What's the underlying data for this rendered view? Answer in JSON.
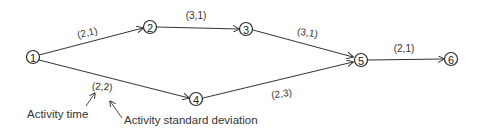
{
  "diagram": {
    "type": "activity network",
    "nodes": [
      {
        "id": "1",
        "label": "1",
        "x": 33,
        "y": 57
      },
      {
        "id": "2",
        "label": "2",
        "x": 150,
        "y": 27
      },
      {
        "id": "3",
        "label": "3",
        "x": 246,
        "y": 29
      },
      {
        "id": "4",
        "label": "4",
        "x": 196,
        "y": 99
      },
      {
        "id": "5",
        "label": "5",
        "x": 361,
        "y": 60
      },
      {
        "id": "6",
        "label": "6",
        "x": 451,
        "y": 59
      }
    ],
    "edges": [
      {
        "from": "1",
        "to": "2",
        "label": "(2,1)"
      },
      {
        "from": "2",
        "to": "3",
        "label": "(3,1)"
      },
      {
        "from": "3",
        "to": "5",
        "label": "(3,1)"
      },
      {
        "from": "1",
        "to": "4",
        "label": "(2,2)"
      },
      {
        "from": "4",
        "to": "5",
        "label": "(2,3)"
      },
      {
        "from": "5",
        "to": "6",
        "label": "(2,1)"
      }
    ],
    "annotations": {
      "activity_time": "Activity time",
      "activity_std_dev": "Activity standard deviation"
    },
    "colors": {
      "line": "#333333",
      "background": "#ffffff"
    }
  }
}
